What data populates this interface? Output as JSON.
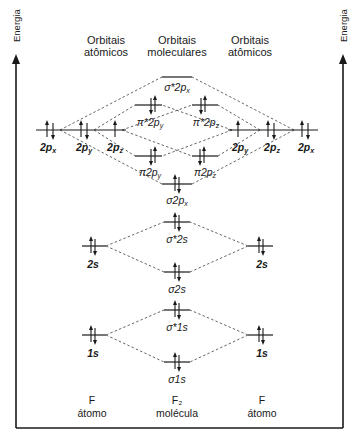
{
  "axis": {
    "left_label": "Energia",
    "right_label": "Energia"
  },
  "headers": {
    "left": [
      "Orbitais",
      "atômicos"
    ],
    "center": [
      "Orbitais",
      "moleculares"
    ],
    "right": [
      "Orbitais",
      "atômicos"
    ]
  },
  "footer": {
    "left": [
      "F",
      "átomo"
    ],
    "center": [
      "F₂",
      "molécula"
    ],
    "right": [
      "F",
      "átomo"
    ]
  },
  "colors": {
    "line": "#1a1a1a",
    "dashed": "#555555",
    "background": "#ffffff"
  },
  "atomic_orbitals": {
    "left": [
      {
        "label": "2pₓ",
        "x": 50,
        "y": 130,
        "electrons": "paired"
      },
      {
        "label": "2pᵧ",
        "x": 84,
        "y": 130,
        "electrons": "paired"
      },
      {
        "label": "2p_z",
        "display": "2p",
        "sub": "z",
        "x": 115,
        "y": 130,
        "electrons": "up"
      },
      {
        "label": "2s",
        "x": 92,
        "y": 246,
        "electrons": "paired"
      },
      {
        "label": "1s",
        "x": 92,
        "y": 335,
        "electrons": "paired"
      }
    ],
    "right": [
      {
        "label": "2pᵧ",
        "x": 238,
        "y": 130,
        "electrons": "up"
      },
      {
        "label": "2p_z",
        "x": 271,
        "y": 130,
        "electrons": "paired"
      },
      {
        "label": "2pₓ",
        "x": 305,
        "y": 130,
        "electrons": "paired"
      },
      {
        "label": "2s",
        "x": 262,
        "y": 246,
        "electrons": "paired"
      },
      {
        "label": "1s",
        "x": 262,
        "y": 335,
        "electrons": "paired"
      }
    ]
  },
  "molecular_orbitals": [
    {
      "label": "σ*2pₓ",
      "x": 177,
      "y": 77,
      "electrons": "empty"
    },
    {
      "label": "π*2pᵧ",
      "x": 148,
      "y": 105,
      "electrons": "paired"
    },
    {
      "label": "π*2p_z",
      "x": 205,
      "y": 105,
      "electrons": "paired"
    },
    {
      "label": "π2pᵧ",
      "x": 148,
      "y": 156,
      "electrons": "paired"
    },
    {
      "label": "π2p_z",
      "x": 205,
      "y": 156,
      "electrons": "paired"
    },
    {
      "label": "σ2pₓ",
      "x": 177,
      "y": 184,
      "electrons": "paired"
    },
    {
      "label": "σ*2s",
      "x": 177,
      "y": 222,
      "electrons": "paired"
    },
    {
      "label": "σ2s",
      "x": 177,
      "y": 272,
      "electrons": "paired"
    },
    {
      "label": "σ*1s",
      "x": 177,
      "y": 310,
      "electrons": "paired"
    },
    {
      "label": "σ1s",
      "x": 177,
      "y": 362,
      "electrons": "paired"
    }
  ],
  "labels": {
    "l2px": "2p",
    "l2px_sub": "x",
    "l2py": "2p",
    "l2py_sub": "y",
    "l2pz": "2p",
    "l2pz_sub": "z",
    "r2py": "2p",
    "r2py_sub": "y",
    "r2pz": "2p",
    "r2pz_sub": "z",
    "r2px": "2p",
    "r2px_sub": "x",
    "l2s": "2s",
    "r2s": "2s",
    "l1s": "1s",
    "r1s": "1s",
    "sig_star_2p": "σ*2p",
    "sig_star_2p_sub": "x",
    "pi_star_2py": "π*2p",
    "pi_star_2py_sub": "y",
    "pi_star_2pz": "π*2p",
    "pi_star_2pz_sub": "z",
    "pi_2py": "π2p",
    "pi_2py_sub": "y",
    "pi_2pz": "π2p",
    "pi_2pz_sub": "z",
    "sig_2p": "σ2p",
    "sig_2p_sub": "x",
    "sig_star_2s": "σ*2s",
    "sig_2s": "σ2s",
    "sig_star_1s": "σ*1s",
    "sig_1s": "σ1s"
  }
}
